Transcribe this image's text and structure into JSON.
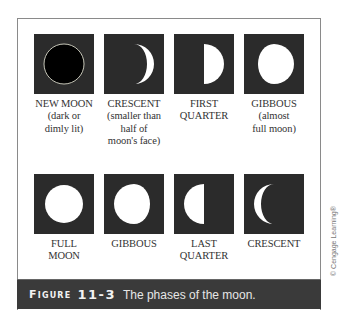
{
  "figure": {
    "caption_label": "Figure",
    "caption_number": "11-3",
    "caption_text": "The phases of the moon.",
    "copyright": "© Cengage Learning®"
  },
  "phases": [
    {
      "name": "new-moon",
      "label": "NEW MOON\n(dark or\ndimly lit)",
      "icon": "new-moon-icon"
    },
    {
      "name": "waxing-crescent",
      "label": "CRESCENT\n(smaller than\nhalf of\nmoon's face)",
      "icon": "waxing-crescent-icon"
    },
    {
      "name": "first-quarter",
      "label": "FIRST\nQUARTER",
      "icon": "first-quarter-icon"
    },
    {
      "name": "waxing-gibbous",
      "label": "GIBBOUS\n(almost\nfull moon)",
      "icon": "waxing-gibbous-icon"
    },
    {
      "name": "full-moon",
      "label": "FULL\nMOON",
      "icon": "full-moon-icon"
    },
    {
      "name": "waning-gibbous",
      "label": "GIBBOUS",
      "icon": "waning-gibbous-icon"
    },
    {
      "name": "last-quarter",
      "label": "LAST\nQUARTER",
      "icon": "last-quarter-icon"
    },
    {
      "name": "waning-crescent",
      "label": "CRESCENT",
      "icon": "waning-crescent-icon"
    }
  ],
  "colors": {
    "box_bg": "#2b2b2b",
    "moon_lit": "#ffffff",
    "caption_bg": "#3a3a3a",
    "frame_border": "#8a8a8a"
  }
}
